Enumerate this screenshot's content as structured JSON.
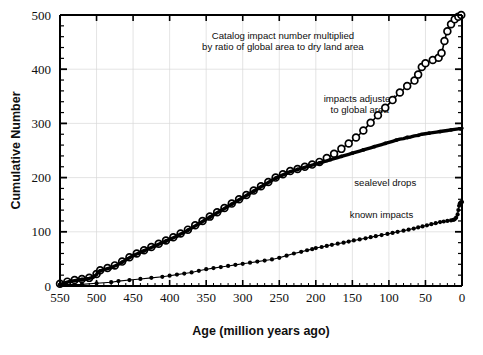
{
  "chart_data": {
    "type": "line",
    "title": "",
    "xlabel": "Age (million years ago)",
    "ylabel": "Cumulative Number",
    "xlim": [
      550,
      0
    ],
    "ylim": [
      0,
      500
    ],
    "x_ticks": [
      550,
      500,
      450,
      400,
      350,
      300,
      250,
      200,
      150,
      100,
      50,
      0
    ],
    "y_ticks": [
      0,
      100,
      200,
      300,
      400,
      500
    ],
    "x_minor_step": 10,
    "y_minor_step": 20,
    "x_axis_inverted": true,
    "grid": true,
    "grid_color": "#d8d8d8",
    "legend_position": "inline-annotations",
    "annotations": [
      {
        "id": "catalog-note",
        "text_line1": "Catalog impact number multiplied",
        "text_line2": "by ratio of global area to dry land area",
        "x": 245,
        "y": 455
      },
      {
        "id": "impacts-adjusted-label",
        "text_line1": "impacts adjusted",
        "text_line2": "to global area",
        "x": 140,
        "y": 340
      },
      {
        "id": "sealevel-label",
        "text_line1": "sealevel drops",
        "x": 105,
        "y": 185
      },
      {
        "id": "known-impacts-label",
        "text_line1": "known impacts",
        "x": 110,
        "y": 125
      }
    ],
    "series": [
      {
        "name": "impacts adjusted to global area",
        "marker": "open-circle",
        "color": "#000000",
        "points": [
          [
            550,
            4
          ],
          [
            545,
            6
          ],
          [
            540,
            8
          ],
          [
            535,
            10
          ],
          [
            530,
            11
          ],
          [
            525,
            12
          ],
          [
            520,
            13
          ],
          [
            515,
            14
          ],
          [
            510,
            15
          ],
          [
            505,
            17
          ],
          [
            500,
            22
          ],
          [
            498,
            27
          ],
          [
            495,
            29
          ],
          [
            490,
            31
          ],
          [
            485,
            33
          ],
          [
            480,
            35
          ],
          [
            475,
            38
          ],
          [
            470,
            41
          ],
          [
            465,
            45
          ],
          [
            460,
            49
          ],
          [
            455,
            53
          ],
          [
            450,
            57
          ],
          [
            445,
            60
          ],
          [
            440,
            63
          ],
          [
            435,
            66
          ],
          [
            430,
            69
          ],
          [
            425,
            72
          ],
          [
            420,
            75
          ],
          [
            415,
            78
          ],
          [
            410,
            81
          ],
          [
            405,
            84
          ],
          [
            400,
            87
          ],
          [
            395,
            90
          ],
          [
            390,
            93
          ],
          [
            385,
            97
          ],
          [
            380,
            100
          ],
          [
            375,
            104
          ],
          [
            370,
            108
          ],
          [
            365,
            112
          ],
          [
            360,
            116
          ],
          [
            355,
            120
          ],
          [
            350,
            124
          ],
          [
            345,
            128
          ],
          [
            340,
            132
          ],
          [
            335,
            136
          ],
          [
            330,
            140
          ],
          [
            325,
            144
          ],
          [
            320,
            148
          ],
          [
            315,
            152
          ],
          [
            310,
            156
          ],
          [
            305,
            160
          ],
          [
            300,
            164
          ],
          [
            295,
            168
          ],
          [
            290,
            172
          ],
          [
            285,
            176
          ],
          [
            280,
            180
          ],
          [
            275,
            184
          ],
          [
            270,
            188
          ],
          [
            265,
            192
          ],
          [
            260,
            196
          ],
          [
            255,
            200
          ],
          [
            250,
            203
          ],
          [
            245,
            206
          ],
          [
            240,
            209
          ],
          [
            235,
            212
          ],
          [
            230,
            214
          ],
          [
            225,
            216
          ],
          [
            220,
            218
          ],
          [
            215,
            220
          ],
          [
            210,
            222
          ],
          [
            205,
            224
          ],
          [
            200,
            226
          ],
          [
            195,
            229
          ],
          [
            190,
            232
          ],
          [
            185,
            236
          ],
          [
            180,
            240
          ],
          [
            175,
            244
          ],
          [
            170,
            248
          ],
          [
            165,
            253
          ],
          [
            160,
            258
          ],
          [
            155,
            263
          ],
          [
            150,
            268
          ],
          [
            145,
            274
          ],
          [
            140,
            280
          ],
          [
            135,
            287
          ],
          [
            130,
            294
          ],
          [
            125,
            301
          ],
          [
            120,
            308
          ],
          [
            115,
            315
          ],
          [
            110,
            322
          ],
          [
            105,
            329
          ],
          [
            100,
            336
          ],
          [
            95,
            343
          ],
          [
            90,
            350
          ],
          [
            85,
            357
          ],
          [
            80,
            363
          ],
          [
            75,
            369
          ],
          [
            70,
            374
          ],
          [
            65,
            379
          ],
          [
            62,
            383
          ],
          [
            60,
            390
          ],
          [
            58,
            398
          ],
          [
            55,
            404
          ],
          [
            52,
            408
          ],
          [
            50,
            411
          ],
          [
            45,
            414
          ],
          [
            40,
            417
          ],
          [
            35,
            419
          ],
          [
            32,
            421
          ],
          [
            30,
            424
          ],
          [
            28,
            430
          ],
          [
            26,
            440
          ],
          [
            24,
            452
          ],
          [
            22,
            462
          ],
          [
            20,
            470
          ],
          [
            18,
            477
          ],
          [
            15,
            483
          ],
          [
            12,
            488
          ],
          [
            10,
            492
          ],
          [
            7,
            495
          ],
          [
            5,
            497
          ],
          [
            3,
            499
          ],
          [
            1,
            500
          ],
          [
            0,
            500
          ]
        ]
      },
      {
        "name": "sealevel drops",
        "marker": "filled-dot",
        "color": "#000000",
        "points": [
          [
            550,
            3
          ],
          [
            545,
            5
          ],
          [
            540,
            7
          ],
          [
            535,
            9
          ],
          [
            530,
            10
          ],
          [
            525,
            11
          ],
          [
            520,
            12
          ],
          [
            515,
            13
          ],
          [
            510,
            14
          ],
          [
            505,
            16
          ],
          [
            500,
            21
          ],
          [
            498,
            26
          ],
          [
            495,
            28
          ],
          [
            490,
            30
          ],
          [
            485,
            32
          ],
          [
            480,
            34
          ],
          [
            475,
            37
          ],
          [
            470,
            40
          ],
          [
            465,
            44
          ],
          [
            460,
            48
          ],
          [
            455,
            52
          ],
          [
            450,
            56
          ],
          [
            445,
            59
          ],
          [
            440,
            62
          ],
          [
            435,
            65
          ],
          [
            430,
            68
          ],
          [
            425,
            71
          ],
          [
            420,
            74
          ],
          [
            415,
            77
          ],
          [
            410,
            80
          ],
          [
            405,
            83
          ],
          [
            400,
            86
          ],
          [
            395,
            89
          ],
          [
            390,
            92
          ],
          [
            385,
            96
          ],
          [
            380,
            99
          ],
          [
            375,
            103
          ],
          [
            370,
            107
          ],
          [
            365,
            111
          ],
          [
            360,
            115
          ],
          [
            355,
            119
          ],
          [
            350,
            123
          ],
          [
            345,
            127
          ],
          [
            340,
            131
          ],
          [
            335,
            135
          ],
          [
            330,
            139
          ],
          [
            325,
            143
          ],
          [
            320,
            147
          ],
          [
            315,
            151
          ],
          [
            310,
            155
          ],
          [
            305,
            159
          ],
          [
            300,
            163
          ],
          [
            295,
            167
          ],
          [
            290,
            171
          ],
          [
            285,
            175
          ],
          [
            280,
            179
          ],
          [
            275,
            183
          ],
          [
            270,
            187
          ],
          [
            265,
            191
          ],
          [
            260,
            195
          ],
          [
            255,
            199
          ],
          [
            250,
            202
          ],
          [
            245,
            205
          ],
          [
            240,
            208
          ],
          [
            235,
            211
          ],
          [
            230,
            213
          ],
          [
            225,
            215
          ],
          [
            220,
            217
          ],
          [
            215,
            219
          ],
          [
            210,
            221
          ],
          [
            205,
            223
          ],
          [
            200,
            225
          ],
          [
            195,
            227
          ],
          [
            190,
            229
          ],
          [
            185,
            231
          ],
          [
            180,
            233
          ],
          [
            175,
            235
          ],
          [
            170,
            237
          ],
          [
            165,
            239
          ],
          [
            160,
            241
          ],
          [
            155,
            243
          ],
          [
            150,
            245
          ],
          [
            145,
            247
          ],
          [
            140,
            249
          ],
          [
            135,
            251
          ],
          [
            130,
            253
          ],
          [
            125,
            255
          ],
          [
            120,
            257
          ],
          [
            115,
            259
          ],
          [
            110,
            261
          ],
          [
            105,
            263
          ],
          [
            100,
            265
          ],
          [
            95,
            267
          ],
          [
            90,
            269
          ],
          [
            85,
            271
          ],
          [
            80,
            272
          ],
          [
            75,
            274
          ],
          [
            70,
            275
          ],
          [
            65,
            277
          ],
          [
            60,
            278
          ],
          [
            55,
            280
          ],
          [
            50,
            281
          ],
          [
            45,
            282
          ],
          [
            40,
            283
          ],
          [
            35,
            284
          ],
          [
            30,
            285
          ],
          [
            25,
            286
          ],
          [
            20,
            287
          ],
          [
            15,
            288
          ],
          [
            10,
            289
          ],
          [
            5,
            290
          ],
          [
            2,
            290
          ],
          [
            0,
            291
          ]
        ]
      },
      {
        "name": "known impacts",
        "marker": "filled-diamond",
        "color": "#000000",
        "points": [
          [
            550,
            2
          ],
          [
            520,
            3
          ],
          [
            500,
            5
          ],
          [
            480,
            7
          ],
          [
            470,
            9
          ],
          [
            455,
            11
          ],
          [
            440,
            13
          ],
          [
            425,
            15
          ],
          [
            410,
            17
          ],
          [
            400,
            19
          ],
          [
            390,
            21
          ],
          [
            380,
            23
          ],
          [
            370,
            25
          ],
          [
            360,
            28
          ],
          [
            350,
            31
          ],
          [
            340,
            33
          ],
          [
            330,
            35
          ],
          [
            320,
            37
          ],
          [
            310,
            39
          ],
          [
            300,
            41
          ],
          [
            290,
            43
          ],
          [
            280,
            45
          ],
          [
            270,
            47
          ],
          [
            260,
            49
          ],
          [
            250,
            52
          ],
          [
            240,
            56
          ],
          [
            230,
            60
          ],
          [
            220,
            63
          ],
          [
            212,
            66
          ],
          [
            205,
            68
          ],
          [
            200,
            70
          ],
          [
            192,
            72
          ],
          [
            185,
            74
          ],
          [
            178,
            76
          ],
          [
            170,
            78
          ],
          [
            162,
            80
          ],
          [
            155,
            82
          ],
          [
            148,
            84
          ],
          [
            140,
            86
          ],
          [
            132,
            88
          ],
          [
            125,
            90
          ],
          [
            118,
            92
          ],
          [
            110,
            94
          ],
          [
            102,
            96
          ],
          [
            95,
            98
          ],
          [
            88,
            100
          ],
          [
            80,
            102
          ],
          [
            73,
            104
          ],
          [
            66,
            106
          ],
          [
            60,
            108
          ],
          [
            54,
            110
          ],
          [
            48,
            112
          ],
          [
            42,
            114
          ],
          [
            36,
            116
          ],
          [
            30,
            118
          ],
          [
            25,
            119
          ],
          [
            20,
            120
          ],
          [
            15,
            121
          ],
          [
            12,
            122
          ],
          [
            10,
            123
          ],
          [
            8,
            126
          ],
          [
            6,
            132
          ],
          [
            5,
            140
          ],
          [
            4,
            148
          ],
          [
            3,
            152
          ],
          [
            2,
            154
          ],
          [
            1,
            155
          ],
          [
            0,
            155
          ]
        ]
      }
    ]
  }
}
